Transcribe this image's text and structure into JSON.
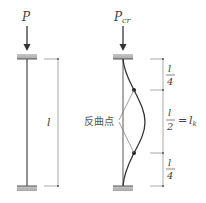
{
  "diagram": {
    "title": "",
    "left_column": {
      "load_label": "P",
      "length_label": "l"
    },
    "right_column": {
      "load_label_main": "P",
      "load_label_sub": "cr",
      "segments": [
        {
          "num": "l",
          "den": "4"
        },
        {
          "num": "l",
          "den": "2",
          "eq": "=",
          "rhs_main": "l",
          "rhs_sub": "k"
        },
        {
          "num": "l",
          "den": "4"
        }
      ],
      "inflection_label": "反曲点"
    },
    "colors": {
      "line": "#555555",
      "dim_line": "#777777",
      "support_fill": "#b8b8b8",
      "text": "#444444",
      "dot": "#222222"
    }
  }
}
